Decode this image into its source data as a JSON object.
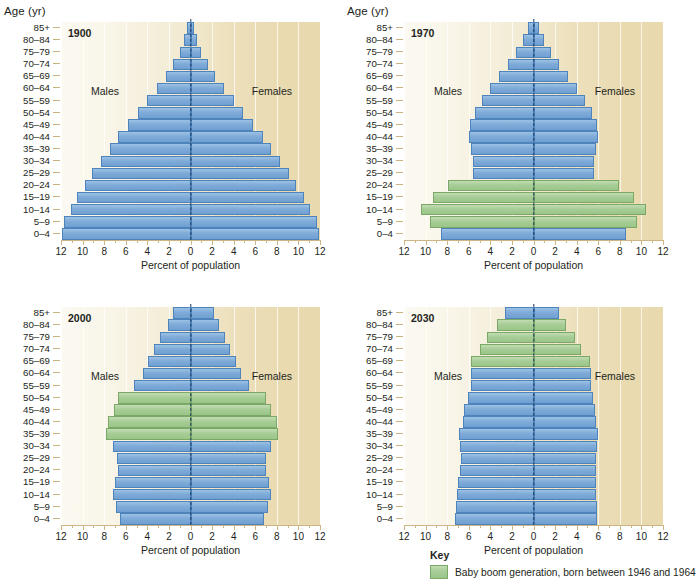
{
  "figure": {
    "age_axis_title": "Age (yr)",
    "x_axis_title": "Percent of population",
    "males_label": "Males",
    "females_label": "Females",
    "age_groups": [
      "85+",
      "80–84",
      "75–79",
      "70–74",
      "65–69",
      "60–64",
      "55–59",
      "50–54",
      "45–49",
      "40–44",
      "35–39",
      "30–34",
      "25–29",
      "20–24",
      "15–19",
      "10–14",
      "5–9",
      "0–4"
    ],
    "x_tick_labels": [
      "12",
      "10",
      "8",
      "6",
      "4",
      "2",
      "0",
      "2",
      "4",
      "6",
      "8",
      "10",
      "12"
    ],
    "x_tick_values": [
      -12,
      -10,
      -8,
      -6,
      -4,
      -2,
      0,
      2,
      4,
      6,
      8,
      10,
      12
    ],
    "colors": {
      "blue_bar": "#7fabd8",
      "green_bar": "#a7cd96",
      "plot_background_left": "#fbf9f2",
      "plot_background_right": "#e8d9ae",
      "midline": "#1c3c63",
      "axis": "#cdb685"
    }
  },
  "key": {
    "title": "Key",
    "entry": "Baby boom generation, born between 1946 and 1964"
  },
  "chart_data": [
    {
      "type": "bar",
      "title": "1900",
      "subtype": "population-pyramid",
      "xlabel": "Percent of population",
      "ylabel": "Age (yr)",
      "xlim": [
        -12,
        12
      ],
      "grid": true,
      "legend_position": "none",
      "show_age_axis_title": true,
      "categories": [
        "85+",
        "80–84",
        "75–79",
        "70–74",
        "65–69",
        "60–64",
        "55–59",
        "50–54",
        "45–49",
        "40–44",
        "35–39",
        "30–34",
        "25–29",
        "20–24",
        "15–19",
        "10–14",
        "5–9",
        "0–4"
      ],
      "series": [
        {
          "name": "Males",
          "values": [
            0.3,
            0.6,
            1.0,
            1.6,
            2.3,
            3.1,
            4.0,
            4.9,
            5.8,
            6.7,
            7.5,
            8.3,
            9.1,
            9.8,
            10.5,
            11.1,
            11.7,
            11.9
          ]
        },
        {
          "name": "Females",
          "values": [
            0.3,
            0.6,
            1.0,
            1.6,
            2.3,
            3.1,
            4.0,
            4.9,
            5.8,
            6.7,
            7.5,
            8.3,
            9.1,
            9.8,
            10.5,
            11.1,
            11.7,
            11.9
          ]
        }
      ],
      "baby_boom_rows": []
    },
    {
      "type": "bar",
      "title": "1970",
      "subtype": "population-pyramid",
      "xlabel": "Percent of population",
      "ylabel": "Age (yr)",
      "xlim": [
        -12,
        12
      ],
      "grid": true,
      "legend_position": "none",
      "show_age_axis_title": true,
      "categories": [
        "85+",
        "80–84",
        "75–79",
        "70–74",
        "65–69",
        "60–64",
        "55–59",
        "50–54",
        "45–49",
        "40–44",
        "35–39",
        "30–34",
        "25–29",
        "20–24",
        "15–19",
        "10–14",
        "5–9",
        "0–4"
      ],
      "series": [
        {
          "name": "Males",
          "values": [
            0.5,
            1.0,
            1.6,
            2.4,
            3.2,
            4.0,
            4.8,
            5.4,
            5.9,
            6.0,
            5.8,
            5.6,
            5.6,
            7.9,
            9.3,
            10.4,
            9.6,
            8.6
          ]
        },
        {
          "name": "Females",
          "values": [
            0.5,
            1.0,
            1.6,
            2.4,
            3.2,
            4.0,
            4.8,
            5.4,
            5.9,
            6.0,
            5.8,
            5.6,
            5.6,
            7.9,
            9.3,
            10.4,
            9.6,
            8.6
          ]
        }
      ],
      "baby_boom_rows": [
        "20–24",
        "15–19",
        "10–14",
        "5–9"
      ]
    },
    {
      "type": "bar",
      "title": "2000",
      "subtype": "population-pyramid",
      "xlabel": "Percent of population",
      "ylabel": "Age (yr)",
      "xlim": [
        -12,
        12
      ],
      "grid": true,
      "legend_position": "none",
      "show_age_axis_title": false,
      "categories": [
        "85+",
        "80–84",
        "75–79",
        "70–74",
        "65–69",
        "60–64",
        "55–59",
        "50–54",
        "45–49",
        "40–44",
        "35–39",
        "30–34",
        "25–29",
        "20–24",
        "15–19",
        "10–14",
        "5–9",
        "0–4"
      ],
      "series": [
        {
          "name": "Males",
          "values": [
            1.6,
            2.1,
            2.8,
            3.4,
            3.9,
            4.4,
            5.2,
            6.7,
            7.1,
            7.6,
            7.8,
            7.2,
            6.8,
            6.7,
            7.0,
            7.2,
            6.9,
            6.5
          ]
        },
        {
          "name": "Females",
          "values": [
            2.2,
            2.6,
            3.2,
            3.7,
            4.2,
            4.7,
            5.4,
            7.0,
            7.5,
            8.0,
            8.1,
            7.5,
            7.0,
            7.0,
            7.3,
            7.5,
            7.2,
            6.8
          ]
        }
      ],
      "baby_boom_rows": [
        "50–54",
        "45–49",
        "40–44",
        "35–39"
      ]
    },
    {
      "type": "bar",
      "title": "2030",
      "subtype": "population-pyramid",
      "xlabel": "Percent of population",
      "ylabel": "Age (yr)",
      "xlim": [
        -12,
        12
      ],
      "grid": true,
      "legend_position": "none",
      "show_age_axis_title": false,
      "categories": [
        "85+",
        "80–84",
        "75–79",
        "70–74",
        "65–69",
        "60–64",
        "55–59",
        "50–54",
        "45–49",
        "40–44",
        "35–39",
        "30–34",
        "25–29",
        "20–24",
        "15–19",
        "10–14",
        "5–9",
        "0–4"
      ],
      "series": [
        {
          "name": "Males",
          "values": [
            2.6,
            3.4,
            4.3,
            5.0,
            5.8,
            5.8,
            5.8,
            6.1,
            6.4,
            6.5,
            6.9,
            6.8,
            6.7,
            6.8,
            7.0,
            7.1,
            7.2,
            7.3
          ]
        },
        {
          "name": "Females",
          "values": [
            2.4,
            3.0,
            3.8,
            4.4,
            5.2,
            5.3,
            5.3,
            5.5,
            5.7,
            5.8,
            6.0,
            5.9,
            5.8,
            5.8,
            5.8,
            5.8,
            5.9,
            5.9
          ]
        }
      ],
      "baby_boom_rows": [
        "80–84",
        "75–79",
        "70–74",
        "65–69"
      ]
    }
  ]
}
